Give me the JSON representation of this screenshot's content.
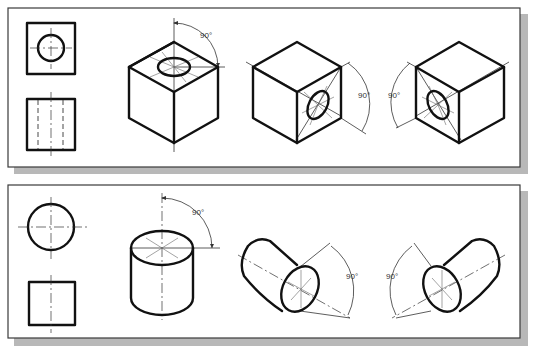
{
  "figure": {
    "panels": [
      {
        "id": "cube-panel",
        "orthographic_views": [
          "top-view-square-with-circle",
          "front-view-square-with-hidden-lines"
        ],
        "isometric_views": [
          {
            "name": "cube-hole-top",
            "angle_label": "90°"
          },
          {
            "name": "cube-hole-right",
            "angle_label": "90°"
          },
          {
            "name": "cube-hole-left",
            "angle_label": "90°"
          }
        ]
      },
      {
        "id": "cylinder-panel",
        "orthographic_views": [
          "top-view-circle",
          "front-view-square"
        ],
        "isometric_views": [
          {
            "name": "cylinder-vertical",
            "angle_label": "90°"
          },
          {
            "name": "cylinder-right",
            "angle_label": "90°"
          },
          {
            "name": "cylinder-left",
            "angle_label": "90°"
          }
        ]
      }
    ],
    "colors": {
      "line": "#111111",
      "panel_border": "#3a3a3a",
      "shadow": "#b8b8b8",
      "background": "#ffffff"
    }
  }
}
